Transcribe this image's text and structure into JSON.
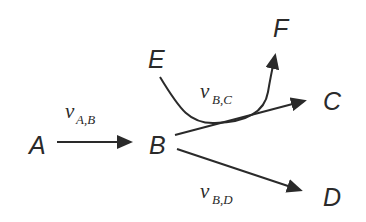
{
  "diagram": {
    "type": "flow-network",
    "colors": {
      "ink": "#2a2a2a",
      "background": "#ffffff"
    },
    "nodes": {
      "A": {
        "label": "A"
      },
      "B": {
        "label": "B"
      },
      "C": {
        "label": "C"
      },
      "D": {
        "label": "D"
      },
      "E": {
        "label": "E"
      },
      "F": {
        "label": "F"
      }
    },
    "edges": {
      "ab": {
        "from": "A",
        "to": "B",
        "var": "v",
        "sub": "A,B"
      },
      "bc": {
        "from": "B",
        "to": "C",
        "var": "v",
        "sub": "B,C"
      },
      "bd": {
        "from": "B",
        "to": "D",
        "var": "v",
        "sub": "B,D"
      },
      "ef": {
        "from": "E",
        "to": "F",
        "var": "",
        "sub": ""
      }
    }
  }
}
